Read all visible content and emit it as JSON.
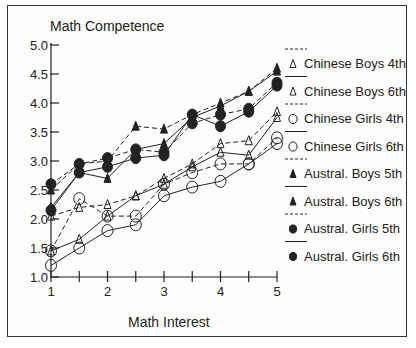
{
  "chart_data": {
    "type": "line",
    "title": "",
    "ylabel": "Math Competence",
    "xlabel": "Math Interest",
    "xlim": [
      1,
      5
    ],
    "ylim": [
      1.0,
      5.0
    ],
    "x_ticks": [
      1,
      2,
      3,
      4,
      5
    ],
    "x_tick_labels": [
      "1",
      "2",
      "3",
      "4",
      "5"
    ],
    "y_ticks": [
      1.0,
      1.5,
      2.0,
      2.5,
      3.0,
      3.5,
      4.0,
      4.5,
      5.0
    ],
    "y_tick_labels": [
      "1.0",
      "1.5",
      "2.0",
      "2.5",
      "3.0",
      "3.5",
      "4.0",
      "4.5",
      "5.0"
    ],
    "grid": false,
    "legend_position": "right",
    "x": [
      1,
      1.5,
      2,
      2.5,
      3,
      3.5,
      4,
      4.5,
      5
    ],
    "series": [
      {
        "name": "Chinese Boys 4th",
        "marker": "triangle-open",
        "line": "dashed",
        "values": [
          2.05,
          2.2,
          2.25,
          2.4,
          2.7,
          2.95,
          3.3,
          3.35,
          3.85
        ]
      },
      {
        "name": "Chinese Boys 6th",
        "marker": "triangle-open",
        "line": "solid",
        "values": [
          1.45,
          1.65,
          2.05,
          2.4,
          2.6,
          2.9,
          3.15,
          3.1,
          3.75
        ]
      },
      {
        "name": "Chinese Girls 4th",
        "marker": "circle-open",
        "line": "dashed",
        "values": [
          1.45,
          2.35,
          2.05,
          2.05,
          2.6,
          2.8,
          2.95,
          2.95,
          3.4
        ]
      },
      {
        "name": "Chinese Girls 6th",
        "marker": "circle-open",
        "line": "solid",
        "values": [
          1.2,
          1.5,
          1.8,
          1.9,
          2.4,
          2.55,
          2.65,
          2.95,
          3.3
        ]
      },
      {
        "name": "Austral. Boys 5th",
        "marker": "triangle-filled",
        "line": "dashed",
        "values": [
          2.5,
          2.95,
          3.0,
          3.6,
          3.55,
          3.8,
          4.0,
          4.2,
          4.6
        ]
      },
      {
        "name": "Austral. Boys  6th",
        "marker": "triangle-filled",
        "line": "solid",
        "values": [
          2.2,
          2.8,
          2.7,
          3.2,
          3.3,
          3.75,
          3.95,
          4.2,
          4.55
        ]
      },
      {
        "name": "Austral. Girls 5th",
        "marker": "circle-filled",
        "line": "dashed",
        "values": [
          2.6,
          2.95,
          3.05,
          3.2,
          3.15,
          3.65,
          3.8,
          3.9,
          4.35
        ]
      },
      {
        "name": "Austral. Girls 6th",
        "marker": "circle-filled",
        "line": "solid",
        "values": [
          2.15,
          2.8,
          2.9,
          3.05,
          3.1,
          3.8,
          3.6,
          3.85,
          4.3
        ]
      }
    ],
    "colors": {
      "ink": "#222222",
      "background": "#fdfdfb"
    }
  }
}
